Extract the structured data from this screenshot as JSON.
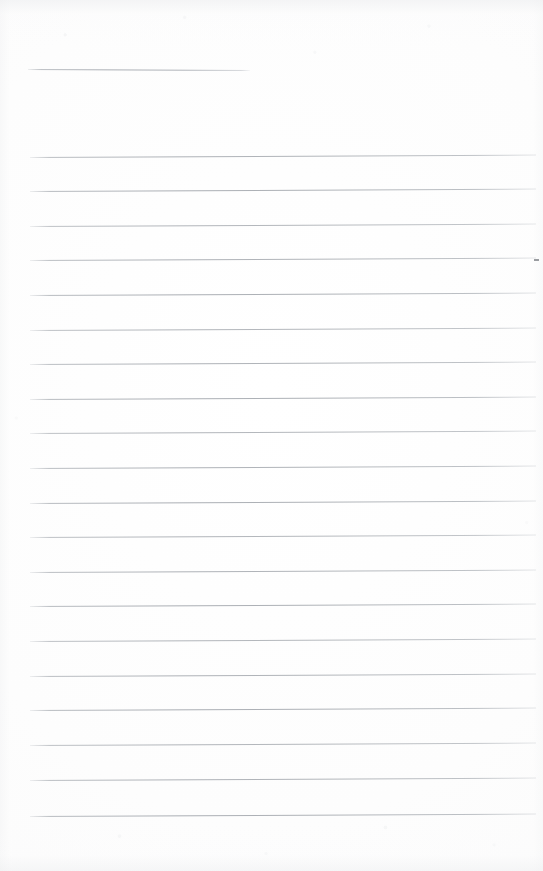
{
  "document": {
    "kind": "scanned-lined-notepad-page",
    "page_state": "blank",
    "visible_text": "",
    "paper_color": "#fdfdfd",
    "rule_color": "#aeb2b8",
    "width_px": 543,
    "height_px": 871
  },
  "header_rule": {
    "name": "header-rule",
    "x": 28,
    "y": 69,
    "length": 222,
    "tilt_deg": 0.26
  },
  "ruled_lines": {
    "count": 20,
    "left_x": 30,
    "right_x": 536,
    "first_y": 157,
    "spacing": 34.7,
    "tilt_deg": -0.28,
    "lines": [
      {
        "index": 1,
        "y": 157
      },
      {
        "index": 2,
        "y": 191
      },
      {
        "index": 3,
        "y": 226
      },
      {
        "index": 4,
        "y": 260
      },
      {
        "index": 5,
        "y": 295
      },
      {
        "index": 6,
        "y": 330
      },
      {
        "index": 7,
        "y": 364
      },
      {
        "index": 8,
        "y": 399
      },
      {
        "index": 9,
        "y": 433
      },
      {
        "index": 10,
        "y": 468
      },
      {
        "index": 11,
        "y": 503
      },
      {
        "index": 12,
        "y": 537
      },
      {
        "index": 13,
        "y": 572
      },
      {
        "index": 14,
        "y": 606
      },
      {
        "index": 15,
        "y": 641
      },
      {
        "index": 16,
        "y": 676
      },
      {
        "index": 17,
        "y": 710
      },
      {
        "index": 18,
        "y": 745
      },
      {
        "index": 19,
        "y": 780
      },
      {
        "index": 20,
        "y": 816
      }
    ]
  },
  "margins": {
    "top_blank_px": 157,
    "bottom_blank_px": 55,
    "left_px": 30,
    "right_px": 7
  }
}
